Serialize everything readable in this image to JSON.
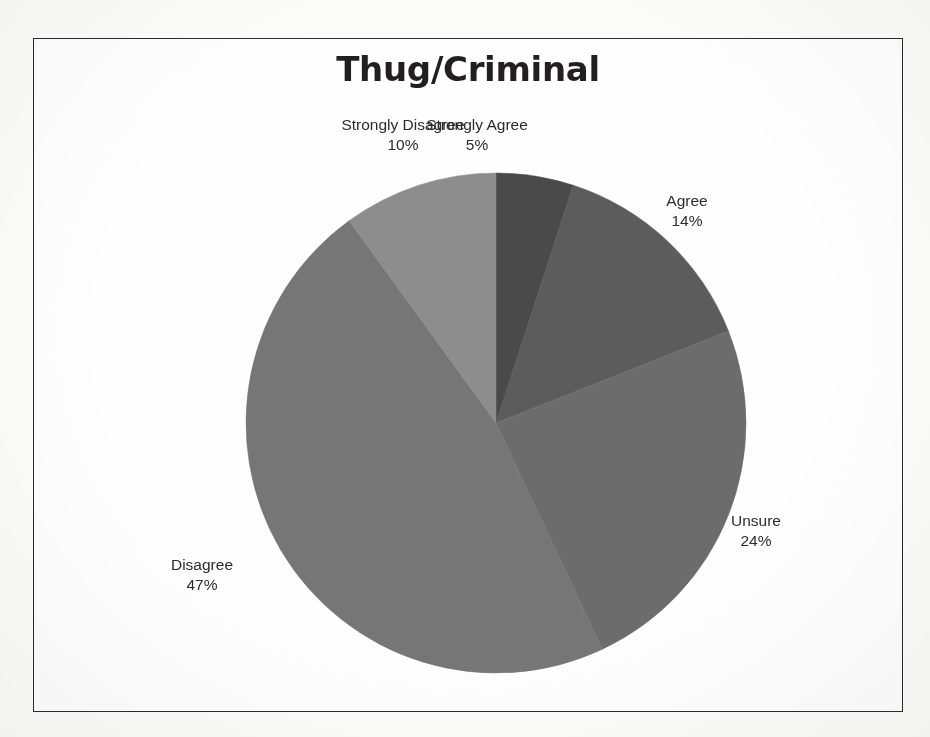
{
  "figure": {
    "title": "Thug/Criminal",
    "frame_color": "#2b2b2b",
    "background_color": "#fefefe"
  },
  "chart_data": {
    "type": "pie",
    "title": "Thug/Criminal",
    "xlabel": "",
    "ylabel": "",
    "legend": "none",
    "labels_position": "outside-with-percent",
    "start_angle_deg": 0,
    "direction": "clockwise",
    "categories": [
      "Strongly Agree",
      "Agree",
      "Unsure",
      "Disagree",
      "Strongly Disagree"
    ],
    "values": [
      5,
      14,
      24,
      47,
      10
    ],
    "value_unit": "percent",
    "total": 100,
    "colors": [
      "#4a4a4a",
      "#5c5c5c",
      "#6c6c6c",
      "#767676",
      "#8d8d8d"
    ],
    "slices": [
      {
        "label": "Strongly Agree",
        "percent": 5,
        "percent_text": "5%",
        "color": "#4a4a4a"
      },
      {
        "label": "Agree",
        "percent": 14,
        "percent_text": "14%",
        "color": "#5c5c5c"
      },
      {
        "label": "Unsure",
        "percent": 24,
        "percent_text": "24%",
        "color": "#6c6c6c"
      },
      {
        "label": "Disagree",
        "percent": 47,
        "percent_text": "47%",
        "color": "#767676"
      },
      {
        "label": "Strongly Disagree",
        "percent": 10,
        "percent_text": "10%",
        "color": "#8d8d8d"
      }
    ]
  }
}
